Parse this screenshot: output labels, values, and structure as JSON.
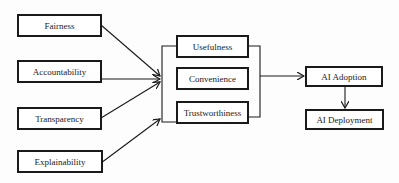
{
  "diagram": {
    "type": "flow-diagram",
    "factors": [
      {
        "id": "fairness",
        "label": "Fairness"
      },
      {
        "id": "accountability",
        "label": "Accountability"
      },
      {
        "id": "transparency",
        "label": "Transparency"
      },
      {
        "id": "explainability",
        "label": "Explainability"
      }
    ],
    "mediators": [
      {
        "id": "usefulness",
        "label": "Usefulness"
      },
      {
        "id": "convenience",
        "label": "Convenience"
      },
      {
        "id": "trustworthiness",
        "label": "Trustworthiness"
      }
    ],
    "outcomes": [
      {
        "id": "ai-adoption",
        "label": "AI Adoption"
      },
      {
        "id": "ai-deployment",
        "label": "AI Deployment"
      }
    ],
    "edges": [
      {
        "from": "fairness",
        "to": "mediators-group"
      },
      {
        "from": "accountability",
        "to": "mediators-group"
      },
      {
        "from": "transparency",
        "to": "mediators-group"
      },
      {
        "from": "explainability",
        "to": "mediators-group"
      },
      {
        "from": "mediators-group",
        "to": "ai-adoption"
      },
      {
        "from": "ai-adoption",
        "to": "ai-deployment"
      }
    ],
    "colors": {
      "stroke": "#1a1a1a",
      "background": "#ffffff"
    }
  }
}
